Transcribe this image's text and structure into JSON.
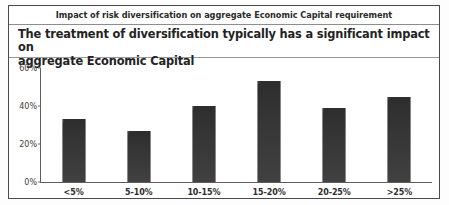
{
  "header": {
    "title": "Impact of risk diversification on aggregate Economic Capital requirement"
  },
  "subtitle": {
    "line1": "The treatment of diversification typically has a significant impact on",
    "line2": "aggregate Economic Capital"
  },
  "colors": {
    "bar": "#3a3a3a",
    "axis": "#5e5e5e",
    "border": "#4a4a4a",
    "text": "#232323"
  },
  "chart_data": {
    "type": "bar",
    "title": "Impact of risk diversification on aggregate Economic Capital requirement",
    "categories": [
      "<5%",
      "5-10%",
      "10-15%",
      "15-20%",
      "20-25%",
      ">25%"
    ],
    "values": [
      33,
      27,
      40,
      53,
      39,
      45
    ],
    "xlabel": "",
    "ylabel": "",
    "ylim": [
      0,
      60
    ],
    "yticks": [
      0,
      20,
      40,
      60
    ],
    "ytick_labels": [
      "0%",
      "20%",
      "40%",
      "60%"
    ],
    "grid": false,
    "legend": false,
    "series": [
      {
        "name": "Share of respondents",
        "values": [
          33,
          27,
          40,
          53,
          39,
          45
        ]
      }
    ]
  }
}
